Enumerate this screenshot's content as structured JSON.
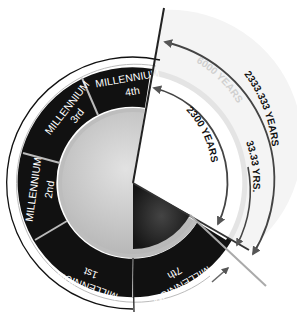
{
  "diagram": {
    "segments": [
      {
        "label": "MILLENNIUM",
        "ordinal": "1st"
      },
      {
        "label": "MILLENNIUM",
        "ordinal": "2nd"
      },
      {
        "label": "MILLENNIUM",
        "ordinal": "3rd"
      },
      {
        "label": "MILLENNIUM",
        "ordinal": "4th"
      },
      {
        "label": "MILLENNIUM",
        "ordinal": "7th"
      }
    ],
    "ghost_labels": {
      "outer": "6000 YEARS",
      "ring": "MILLENNIUM"
    },
    "arcs": {
      "outer": "2333.333 YEARS",
      "middle": "33.33 YRS.",
      "inner": "2300 YEARS"
    },
    "colors": {
      "ring": "#111111",
      "ghost_ring": "#e4e4e4",
      "disc": "#cfcfcf",
      "dark_wedge": "#2a2a2a",
      "arrow": "#555555"
    }
  }
}
